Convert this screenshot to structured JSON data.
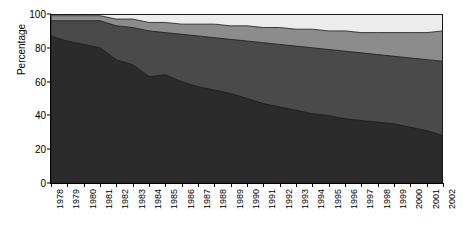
{
  "chart_data": {
    "type": "area",
    "stacked": true,
    "title": "",
    "xlabel": "",
    "ylabel": "Percentage",
    "ylim": [
      0,
      100
    ],
    "yticks": [
      0,
      20,
      40,
      60,
      80,
      100
    ],
    "grid": false,
    "legend": "none",
    "categories": [
      "1978",
      "1979",
      "1980",
      "1981",
      "1982",
      "1983",
      "1984",
      "1985",
      "1986",
      "1987",
      "1988",
      "1989",
      "1990",
      "1991",
      "1992",
      "1993",
      "1994",
      "1995",
      "1996",
      "1997",
      "1998",
      "1999",
      "2000",
      "2001",
      "2002"
    ],
    "x": [
      1978,
      1979,
      1980,
      1981,
      1982,
      1983,
      1984,
      1985,
      1986,
      1987,
      1988,
      1989,
      1990,
      1991,
      1992,
      1993,
      1994,
      1995,
      1996,
      1997,
      1998,
      1999,
      2000,
      2001,
      2002
    ],
    "series": [
      {
        "name": "series-1",
        "color": "#2b2b2b",
        "values": [
          87,
          84,
          82,
          80,
          73,
          70,
          63,
          64,
          60,
          57,
          55,
          53,
          50,
          47,
          45,
          43,
          41,
          40,
          38,
          37,
          36,
          35,
          33,
          31,
          28
        ]
      },
      {
        "name": "series-2",
        "color": "#4a4a4a",
        "values": [
          9,
          12,
          14,
          16,
          20,
          22,
          27,
          25,
          28,
          30,
          31,
          32,
          34,
          36,
          37,
          38,
          39,
          39,
          40,
          40,
          40,
          40,
          41,
          42,
          44
        ]
      },
      {
        "name": "series-3",
        "color": "#8c8c8c",
        "values": [
          3,
          3,
          3,
          3,
          4,
          5,
          5,
          6,
          6,
          7,
          8,
          8,
          9,
          9,
          10,
          10,
          11,
          11,
          12,
          12,
          13,
          14,
          15,
          16,
          18
        ]
      },
      {
        "name": "series-4",
        "color": "#ececec",
        "values": [
          1,
          1,
          1,
          1,
          3,
          3,
          5,
          5,
          6,
          6,
          6,
          7,
          7,
          8,
          8,
          9,
          9,
          10,
          10,
          11,
          11,
          11,
          11,
          11,
          10
        ]
      }
    ],
    "cumulative_tops": [
      [
        87,
        84,
        82,
        80,
        73,
        70,
        63,
        64,
        60,
        57,
        55,
        53,
        50,
        47,
        45,
        43,
        41,
        40,
        38,
        37,
        36,
        35,
        33,
        31,
        28
      ],
      [
        96,
        96,
        96,
        96,
        93,
        92,
        90,
        89,
        88,
        87,
        86,
        85,
        84,
        83,
        82,
        81,
        80,
        79,
        78,
        77,
        76,
        75,
        74,
        73,
        72
      ],
      [
        99,
        99,
        99,
        99,
        97,
        97,
        95,
        95,
        94,
        94,
        94,
        93,
        93,
        92,
        92,
        91,
        91,
        90,
        90,
        89,
        89,
        89,
        89,
        89,
        90
      ],
      [
        100,
        100,
        100,
        100,
        100,
        100,
        100,
        100,
        100,
        100,
        100,
        100,
        100,
        100,
        100,
        100,
        100,
        100,
        100,
        100,
        100,
        100,
        100,
        100,
        100
      ]
    ]
  },
  "axes": {
    "y_label": "Percentage",
    "y_tick_labels": [
      "0",
      "20",
      "40",
      "60",
      "80",
      "100"
    ],
    "x_tick_labels": [
      "1978",
      "1979",
      "1980",
      "1981",
      "1982",
      "1983",
      "1984",
      "1985",
      "1986",
      "1987",
      "1988",
      "1989",
      "1990",
      "1991",
      "1992",
      "1993",
      "1994",
      "1995",
      "1996",
      "1997",
      "1998",
      "1999",
      "2000",
      "2001",
      "2002"
    ]
  },
  "colors": {
    "band_1": "#2b2b2b",
    "band_2": "#4a4a4a",
    "band_3": "#8c8c8c",
    "band_4": "#ececec",
    "axis": "#000000",
    "outline": "#1a1a1a",
    "background": "#ffffff"
  }
}
